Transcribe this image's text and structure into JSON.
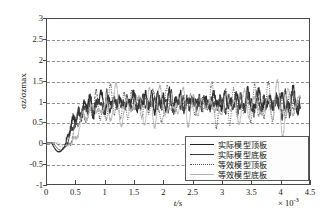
{
  "chart_data": {
    "type": "line",
    "title": "",
    "xlabel": "t/s",
    "ylabel": "σz/σzmax",
    "x_multiplier": "× 10",
    "x_multiplier_exp": "-3",
    "xlim": [
      0,
      4.5
    ],
    "ylim": [
      -1,
      3
    ],
    "xticks": [
      "0",
      "0.5",
      "1",
      "1.5",
      "2",
      "2.5",
      "3",
      "3.5",
      "4",
      "4.5"
    ],
    "yticks": [
      "3",
      "2.5",
      "2",
      "1.5",
      "1",
      "0.5",
      "0",
      "-0.5",
      "-1"
    ],
    "grid": "horizontal-dashed",
    "legend_position": "lower-right",
    "series": [
      {
        "name": "实际模型顶板",
        "style": "solid-thick",
        "color": "#222222"
      },
      {
        "name": "实际模型底板",
        "style": "solid-thin",
        "color": "#3a3a3a"
      },
      {
        "name": "等效模型顶板",
        "style": "dotted",
        "color": "#555555"
      },
      {
        "name": "等效模型底板",
        "style": "light-thin",
        "color": "#b0b0b0"
      }
    ]
  }
}
